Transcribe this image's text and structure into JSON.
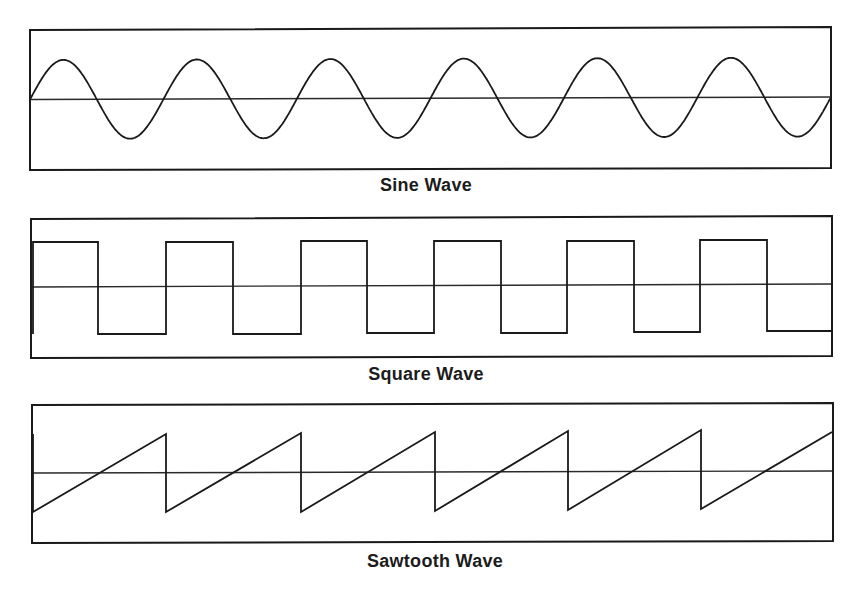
{
  "figure": {
    "panels": [
      {
        "id": "sine",
        "title": "Sine Wave",
        "waveform": "sine",
        "cycles": 6
      },
      {
        "id": "square",
        "title": "Square Wave",
        "waveform": "square",
        "cycles": 6
      },
      {
        "id": "sawtooth",
        "title": "Sawtooth Wave",
        "waveform": "sawtooth",
        "cycles": 6
      }
    ],
    "colors": {
      "line": "#1a1a1a",
      "background": "#ffffff"
    }
  }
}
